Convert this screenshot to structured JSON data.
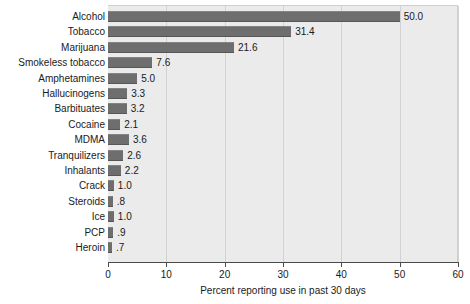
{
  "chart_data": {
    "type": "bar",
    "orientation": "horizontal",
    "title": "",
    "xlabel": "Percent reporting use in past 30 days",
    "ylabel": "",
    "xlim": [
      0,
      60
    ],
    "xticks": [
      "0",
      "10",
      "20",
      "30",
      "40",
      "50",
      "60"
    ],
    "grid": "vertical",
    "legend": "none",
    "bar_color": "#6e6e6e",
    "plot_background": "#ebebeb",
    "categories": [
      "Alcohol",
      "Tobacco",
      "Marijuana",
      "Smokeless tobacco",
      "Amphetamines",
      "Hallucinogens",
      "Barbituates",
      "Cocaine",
      "MDMA",
      "Tranquilizers",
      "Inhalants",
      "Crack",
      "Steroids",
      "Ice",
      "PCP",
      "Heroin"
    ],
    "values": [
      50.0,
      31.4,
      21.6,
      7.6,
      5.0,
      3.3,
      3.2,
      2.1,
      3.6,
      2.6,
      2.2,
      1.0,
      0.8,
      1.0,
      0.9,
      0.7
    ],
    "value_labels": [
      "50.0",
      "31.4",
      "21.6",
      "7.6",
      "5.0",
      "3.3",
      "3.2",
      "2.1",
      "3.6",
      "2.6",
      "2.2",
      "1.0",
      ".8",
      "1.0",
      ".9",
      ".7"
    ]
  }
}
